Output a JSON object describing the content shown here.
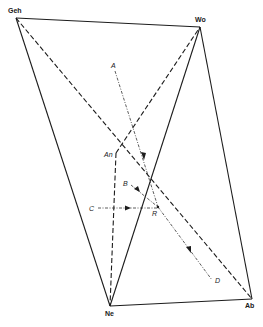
{
  "diagram": {
    "type": "quaternary-phase-diagram",
    "vertices": {
      "Geh": {
        "label": "Geh",
        "x": 16,
        "y": 18
      },
      "Wo": {
        "label": "Wo",
        "x": 200,
        "y": 27
      },
      "An": {
        "label": "An",
        "x": 116,
        "y": 153
      },
      "Ne": {
        "label": "Ne",
        "x": 110,
        "y": 306
      },
      "Ab": {
        "label": "Ab",
        "x": 252,
        "y": 299
      }
    },
    "points": {
      "A": {
        "label": "A",
        "x": 115,
        "y": 70
      },
      "B": {
        "label": "B",
        "x": 131,
        "y": 185
      },
      "C": {
        "label": "C",
        "x": 98,
        "y": 208
      },
      "R": {
        "label": "R",
        "x": 158,
        "y": 207
      },
      "D": {
        "label": "D",
        "x": 212,
        "y": 280
      }
    },
    "solid_edges": [
      [
        "Geh",
        "Wo"
      ],
      [
        "Wo",
        "Ab"
      ],
      [
        "Ab",
        "Ne"
      ],
      [
        "Ne",
        "Geh"
      ],
      [
        "Ne",
        "Wo"
      ]
    ],
    "dashed_edges": [
      [
        "Geh",
        "Ab"
      ],
      [
        "An",
        "Wo"
      ],
      [
        "An",
        "Ne"
      ]
    ],
    "crystallization_paths": [
      [
        "A",
        "R"
      ],
      [
        "B",
        "R"
      ],
      [
        "C",
        "R"
      ],
      [
        "R",
        "D"
      ]
    ]
  }
}
